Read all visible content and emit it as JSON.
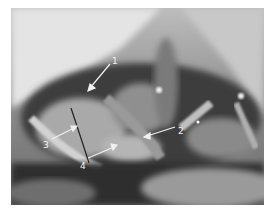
{
  "image": {
    "description": "Grayscale intraoperative surgical photograph with numbered arrow annotations",
    "colors": {
      "arrow": "#f0f0f0",
      "label": "#f2f2f2"
    }
  },
  "annotations": [
    {
      "number": "1",
      "label_pos": [
        112,
        57
      ],
      "arrow_from": [
        110,
        64
      ],
      "arrow_to": [
        88,
        90
      ]
    },
    {
      "number": "2",
      "label_pos": [
        178,
        127
      ],
      "arrow_from": [
        175,
        127
      ],
      "arrow_to": [
        145,
        136
      ]
    },
    {
      "number": "3",
      "label_pos": [
        43,
        141
      ],
      "arrow_from": [
        52,
        139
      ],
      "arrow_to": [
        76,
        127
      ]
    },
    {
      "number": "4",
      "label_pos": [
        80,
        162
      ],
      "arrow_from": [
        88,
        158
      ],
      "arrow_to": [
        116,
        146
      ]
    }
  ]
}
